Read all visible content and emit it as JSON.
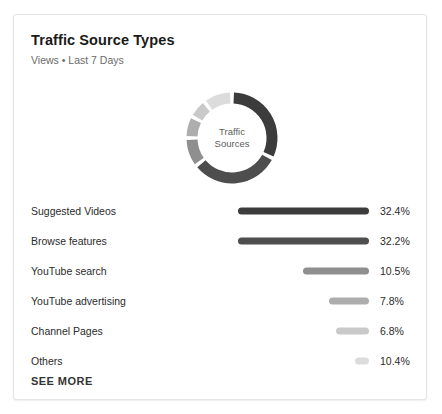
{
  "card": {
    "title": "Traffic Source Types",
    "subtitle": "Views • Last 7 Days",
    "see_more_label": "SEE MORE"
  },
  "donut": {
    "center_line1": "Traffic",
    "center_line2": "Sources"
  },
  "chart_data": {
    "type": "pie",
    "title": "Traffic Source Types",
    "subtitle": "Views • Last 7 Days",
    "xlabel": "",
    "ylabel": "",
    "legend_position": "below-as-bars",
    "grid": false,
    "categories": [
      "Suggested Videos",
      "Browse features",
      "YouTube search",
      "YouTube advertising",
      "Channel Pages",
      "Others"
    ],
    "values": [
      32.4,
      32.2,
      10.5,
      7.8,
      6.8,
      10.4
    ],
    "value_labels": [
      "32.4%",
      "32.2%",
      "10.5%",
      "7.8%",
      "6.8%",
      "10.4%"
    ],
    "bar_lengths_px": [
      131,
      131,
      66,
      40,
      33,
      14
    ],
    "colors": [
      "#3c3c3c",
      "#4e4e4e",
      "#8f8f8f",
      "#adadad",
      "#c9c9c9",
      "#dcdcdc"
    ],
    "donut_segment_sweeps_deg": [
      116.6,
      115.9,
      37.8,
      28.1,
      24.5,
      37.4
    ]
  }
}
